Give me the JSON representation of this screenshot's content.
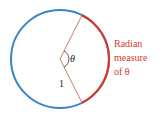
{
  "diagram": {
    "type": "unit-circle-radian",
    "circle": {
      "cx": 60,
      "cy": 59,
      "r": 49,
      "color": "#3a85c6"
    },
    "arc": {
      "color": "#d43a2a"
    },
    "radii_color": "#c86a58",
    "theta_label": "θ",
    "radius_label": "1",
    "annotation": {
      "lines": [
        "Radian",
        "measure",
        "of θ"
      ],
      "color": "#d43a2a"
    }
  }
}
